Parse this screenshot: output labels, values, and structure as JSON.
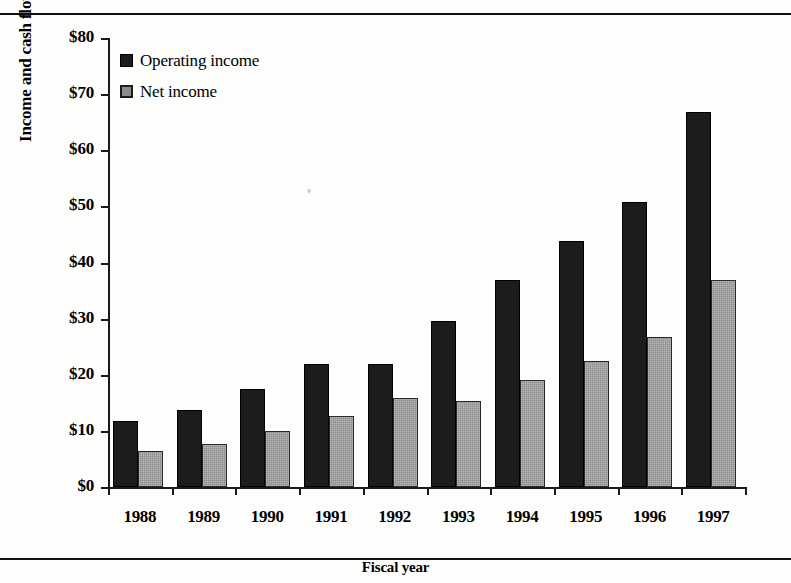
{
  "chart_data": {
    "type": "bar",
    "title": "",
    "xlabel": "Fiscal year",
    "ylabel": "Income and cash flow in millions",
    "categories": [
      "1988",
      "1989",
      "1990",
      "1991",
      "1992",
      "1993",
      "1994",
      "1995",
      "1996",
      "1997"
    ],
    "series": [
      {
        "name": "Operating income",
        "color": "#1c1c1c",
        "values": [
          11.8,
          13.8,
          17.4,
          21.9,
          22.0,
          29.5,
          36.8,
          43.8,
          50.7,
          66.8
        ]
      },
      {
        "name": "Net income",
        "color": "#8b8b8b",
        "values": [
          6.4,
          7.6,
          10.0,
          12.7,
          15.8,
          15.3,
          19.0,
          22.4,
          26.8,
          36.8
        ]
      }
    ],
    "ylim": [
      0,
      80
    ],
    "ytick_values": [
      0,
      10,
      20,
      30,
      40,
      50,
      60,
      70,
      80
    ],
    "ytick_labels": [
      "$0",
      "$10",
      "$20",
      "$30",
      "$40",
      "$50",
      "$60",
      "$70",
      "$80"
    ],
    "grid": false,
    "legend_position": "top-left"
  }
}
